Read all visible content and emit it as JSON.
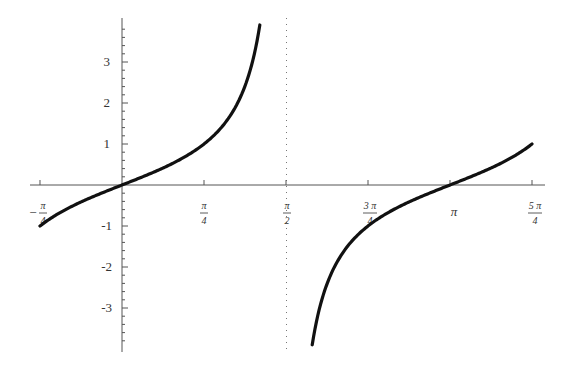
{
  "chart_data": {
    "type": "line",
    "title": "",
    "xlabel": "",
    "ylabel": "",
    "function": "y = tan(x)",
    "xlim": [
      -0.7854,
      3.927
    ],
    "ylim": [
      -3.9,
      3.9
    ],
    "grid": false,
    "legend": null,
    "asymptote": {
      "x": 1.5708,
      "label": "π/2",
      "style": "dotted"
    },
    "x_ticks": [
      {
        "value": -0.7854,
        "label": "-π/4"
      },
      {
        "value": 0.7854,
        "label": "π/4"
      },
      {
        "value": 1.5708,
        "label": "π/2"
      },
      {
        "value": 2.3562,
        "label": "3π/4"
      },
      {
        "value": 3.1416,
        "label": "π"
      },
      {
        "value": 3.927,
        "label": "5π/4"
      }
    ],
    "y_ticks": [
      -3,
      -2,
      -1,
      1,
      2,
      3
    ],
    "series": [
      {
        "name": "tan(x) branch 1",
        "x": [
          -0.7854,
          -0.5,
          0,
          0.5,
          0.7854,
          1.0,
          1.2,
          1.3,
          1.32
        ],
        "y": [
          -1,
          -0.546,
          0,
          0.546,
          1,
          1.557,
          2.572,
          3.602,
          3.9
        ]
      },
      {
        "name": "tan(x) branch 2",
        "x": [
          1.822,
          1.9,
          2.0,
          2.3562,
          2.7,
          3.1416,
          3.5,
          3.927
        ],
        "y": [
          -3.9,
          -2.927,
          -2.185,
          -1,
          -0.473,
          0,
          0.375,
          1
        ]
      }
    ]
  },
  "labels": {
    "x": {
      "neg_pi_4": {
        "sign": "−",
        "num": "π",
        "den": "4"
      },
      "pi_4": {
        "num": "π",
        "den": "4"
      },
      "pi_2": {
        "num": "π",
        "den": "2"
      },
      "three_pi_4": {
        "num": "3 π",
        "den": "4"
      },
      "pi": "π",
      "five_pi_4": {
        "num": "5 π",
        "den": "4"
      }
    },
    "y": {
      "p3": "3",
      "p2": "2",
      "p1": "1",
      "m1": "-1",
      "m2": "-2",
      "m3": "-3"
    }
  }
}
